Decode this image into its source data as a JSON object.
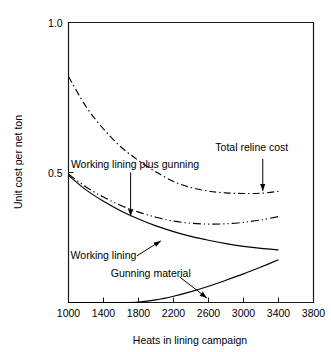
{
  "chart_data": {
    "type": "line",
    "title": "",
    "xlabel": "Heats in lining campaign",
    "ylabel": "Unit cost per net ton",
    "xlim": [
      1000,
      3800
    ],
    "ylim": [
      0.0667,
      1.0
    ],
    "xticks": [
      1000,
      1400,
      1800,
      2200,
      2600,
      3000,
      3400,
      3800
    ],
    "xtick_labels": [
      "1000",
      "1400",
      "1800",
      "2200",
      "2600",
      "3000",
      "3400",
      "3800"
    ],
    "yticks": [
      0.5,
      1.0
    ],
    "ytick_labels": [
      "0.5",
      "1.0"
    ],
    "grid": false,
    "legend_position": "inline-annotations",
    "series": [
      {
        "name": "Total reline cost",
        "style": "dash-dot",
        "x": [
          1000,
          1200,
          1400,
          1600,
          1800,
          2000,
          2200,
          2400,
          2600,
          2800,
          3000,
          3200,
          3400
        ],
        "y": [
          0.82,
          0.72,
          0.645,
          0.585,
          0.54,
          0.502,
          0.47,
          0.45,
          0.438,
          0.432,
          0.43,
          0.431,
          0.437
        ]
      },
      {
        "name": "Working lining plus gunning",
        "style": "dash-dot-dot",
        "x": [
          1000,
          1200,
          1400,
          1600,
          1800,
          2000,
          2200,
          2400,
          2600,
          2800,
          3000,
          3200,
          3400
        ],
        "y": [
          0.495,
          0.452,
          0.418,
          0.39,
          0.368,
          0.351,
          0.338,
          0.331,
          0.328,
          0.329,
          0.334,
          0.342,
          0.353
        ]
      },
      {
        "name": "Working lining",
        "style": "solid",
        "x": [
          1000,
          1200,
          1400,
          1600,
          1800,
          2000,
          2200,
          2400,
          2600,
          2800,
          3000,
          3200,
          3400
        ],
        "y": [
          0.49,
          0.442,
          0.404,
          0.372,
          0.345,
          0.322,
          0.303,
          0.287,
          0.274,
          0.263,
          0.254,
          0.247,
          0.242
        ]
      },
      {
        "name": "Gunning material",
        "style": "solid",
        "x": [
          1000,
          1200,
          1400,
          1600,
          1800,
          2000,
          2200,
          2400,
          2600,
          2800,
          3000,
          3200,
          3400
        ],
        "y": [
          0.0667,
          0.0667,
          0.0667,
          0.0667,
          0.0685,
          0.0755,
          0.0875,
          0.103,
          0.121,
          0.141,
          0.162,
          0.185,
          0.209
        ]
      }
    ],
    "annotations": [
      {
        "id": "total-reline-cost",
        "text": "Total reline cost",
        "label_x": 3095,
        "label_y": 0.585,
        "arrow_from_x": 3220,
        "arrow_from_y": 0.545,
        "arrow_to_x": 3220,
        "arrow_to_y": 0.438,
        "anchor": "middle",
        "arrow_style": "vertical"
      },
      {
        "id": "working-lining-plus-gunning",
        "text": "Working lining plus gunning",
        "label_x": 1760,
        "label_y": 0.53,
        "arrow_from_x": 1710,
        "arrow_from_y": 0.5,
        "arrow_to_x": 1710,
        "arrow_to_y": 0.354,
        "anchor": "middle",
        "arrow_style": "vertical"
      },
      {
        "id": "working-lining",
        "text": "Working lining",
        "label_x": 1400,
        "label_y": 0.225,
        "arrow_from_x": 1780,
        "arrow_from_y": 0.222,
        "arrow_to_x": 2055,
        "arrow_to_y": 0.272,
        "anchor": "middle",
        "arrow_style": "diagonal"
      },
      {
        "id": "gunning-material",
        "text": "Gunning material",
        "label_x": 1940,
        "label_y": 0.165,
        "arrow_from_x": 2270,
        "arrow_from_y": 0.152,
        "arrow_to_x": 2580,
        "arrow_to_y": 0.082,
        "anchor": "middle",
        "arrow_style": "diagonal"
      }
    ]
  }
}
